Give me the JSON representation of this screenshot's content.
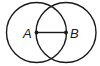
{
  "diagram": {
    "type": "geometry",
    "stroke_color": "#1a1a1a",
    "points": [
      {
        "label": "A",
        "x": 36.5,
        "y": 32.5
      },
      {
        "label": "B",
        "x": 66,
        "y": 32.5
      }
    ],
    "circles": [
      {
        "center": "A",
        "cx": 36.5,
        "cy": 32.5,
        "r": 30
      },
      {
        "center": "B",
        "cx": 66,
        "cy": 32.5,
        "r": 30
      }
    ],
    "segments": [
      {
        "from": "A",
        "to": "B"
      }
    ],
    "labels": {
      "a": "A",
      "b": "B"
    }
  }
}
